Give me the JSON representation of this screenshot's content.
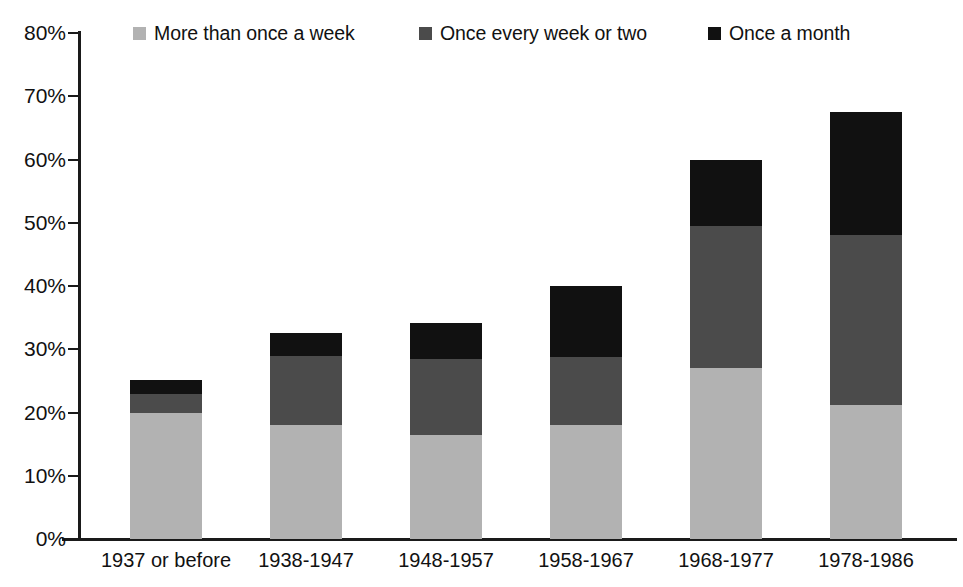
{
  "chart_data": {
    "type": "bar",
    "subtype": "stacked-bar",
    "title": "",
    "subtitle": "",
    "xlabel": "",
    "ylabel": "",
    "categories": [
      "1937 or before",
      "1938-1947",
      "1948-1957",
      "1958-1967",
      "1968-1977",
      "1978-1986"
    ],
    "series": [
      {
        "name": "More than once a week",
        "color": "#b2b2b2",
        "values": [
          20.0,
          18.0,
          16.5,
          18.0,
          27.0,
          21.2
        ]
      },
      {
        "name": "Once every week or two",
        "color": "#4b4b4b",
        "values": [
          3.0,
          11.0,
          12.0,
          10.8,
          22.5,
          26.8
        ]
      },
      {
        "name": "Once a month",
        "color": "#111111",
        "values": [
          2.2,
          3.6,
          5.7,
          11.2,
          10.5,
          19.5
        ]
      }
    ],
    "totals": [
      25.2,
      32.6,
      34.2,
      40.0,
      60.0,
      67.5
    ],
    "ylim": [
      0,
      80
    ],
    "ytick_values": [
      0,
      10,
      20,
      30,
      40,
      50,
      60,
      70,
      80
    ],
    "ytick_labels": [
      "0%",
      "10%",
      "20%",
      "30%",
      "40%",
      "50%",
      "60%",
      "70%",
      "80%"
    ],
    "yunit": "%",
    "grid": false,
    "legend_position": "top",
    "stack_order": "bottom-to-top"
  },
  "legend": {
    "entries": [
      {
        "label": "More than once a week",
        "color": "#b2b2b2"
      },
      {
        "label": "Once every week or two",
        "color": "#4b4b4b"
      },
      {
        "label": "Once a month",
        "color": "#111111"
      }
    ]
  },
  "axes": {
    "y_ticks": [
      {
        "label": "80%",
        "value": 80
      },
      {
        "label": "70%",
        "value": 70
      },
      {
        "label": "60%",
        "value": 60
      },
      {
        "label": "50%",
        "value": 50
      },
      {
        "label": "40%",
        "value": 40
      },
      {
        "label": "30%",
        "value": 30
      },
      {
        "label": "20%",
        "value": 20
      },
      {
        "label": "10%",
        "value": 10
      },
      {
        "label": "0%",
        "value": 0
      }
    ],
    "x_ticks": [
      {
        "label": "1937 or before"
      },
      {
        "label": "1938-1947"
      },
      {
        "label": "1948-1957"
      },
      {
        "label": "1958-1967"
      },
      {
        "label": "1968-1977"
      },
      {
        "label": "1978-1986"
      }
    ]
  },
  "colors": {
    "axis": "#1a1a1a",
    "text": "#111111",
    "background": "#ffffff",
    "series_light": "#b2b2b2",
    "series_mid": "#4b4b4b",
    "series_dark": "#111111"
  }
}
